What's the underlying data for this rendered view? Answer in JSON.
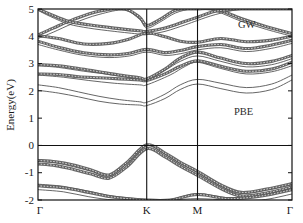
{
  "figure": {
    "title": "",
    "background_color": "#ffffff"
  },
  "axes": {
    "ylabel": "Energy(eV)",
    "xlabel": "",
    "y_ticks": [
      "5",
      "4",
      "3",
      "2",
      "1",
      "0",
      "-1",
      "-2"
    ],
    "x_ticks": [
      "Γ",
      "K",
      "M",
      "Γ"
    ]
  },
  "annotations": {
    "gw_label": "GW",
    "pbe_label": "PBE"
  },
  "chart_data": {
    "type": "line",
    "title": "",
    "xlabel": "",
    "ylabel": "Energy(eV)",
    "ylim": [
      -2,
      5
    ],
    "xlim": [
      0,
      1
    ],
    "grid": false,
    "legend_position": "in-plot-annotations",
    "x_tick_labels": [
      "Γ",
      "K",
      "M",
      "Γ"
    ],
    "x_tick_positions": [
      0.0,
      0.428,
      0.628,
      1.0
    ],
    "y_tick_values": [
      5,
      4,
      3,
      2,
      1,
      0,
      -1,
      -2
    ],
    "high_symmetry_lines": [
      0.428,
      0.628
    ],
    "zero_line": 0,
    "colors": {
      "gw_band": "#5a5a5a",
      "pbe_band": "#4a4a4a",
      "frame": "#111111"
    },
    "series": [
      {
        "name": "GW",
        "style": "thick-with-open-circle-markers",
        "description": "Quasiparticle GW band structure, drawn as thick dotted/circle-marker curves, blue-shifted relative to PBE",
        "bands": [
          {
            "label": "v1",
            "x": [
              0.0,
              0.07,
              0.14,
              0.21,
              0.28,
              0.35,
              0.428,
              0.5,
              0.56,
              0.628,
              0.72,
              0.8,
              0.9,
              1.0
            ],
            "y": [
              -0.55,
              -0.6,
              -0.72,
              -0.9,
              -1.08,
              -0.62,
              0.02,
              -0.28,
              -0.62,
              -0.95,
              -1.45,
              -1.72,
              -1.6,
              -1.4
            ]
          },
          {
            "label": "v2",
            "x": [
              0.0,
              0.07,
              0.14,
              0.21,
              0.28,
              0.35,
              0.428,
              0.5,
              0.56,
              0.628,
              0.72,
              0.8,
              0.9,
              1.0
            ],
            "y": [
              -0.68,
              -0.74,
              -0.88,
              -1.05,
              -1.2,
              -0.78,
              -0.12,
              -0.42,
              -0.76,
              -1.1,
              -1.58,
              -1.85,
              -1.74,
              -1.52
            ]
          },
          {
            "label": "v3",
            "x": [
              0.0,
              0.1,
              0.2,
              0.3,
              0.428,
              0.52,
              0.628,
              0.75,
              0.88,
              1.0
            ],
            "y": [
              -1.48,
              -1.55,
              -1.72,
              -1.9,
              -2.0,
              -2.0,
              -1.8,
              -1.95,
              -1.85,
              -1.62
            ]
          },
          {
            "label": "c1",
            "x": [
              0.0,
              0.08,
              0.16,
              0.24,
              0.32,
              0.4,
              0.428,
              0.5,
              0.56,
              0.628,
              0.72,
              0.82,
              0.92,
              1.0
            ],
            "y": [
              2.62,
              2.6,
              2.52,
              2.48,
              2.44,
              2.4,
              2.38,
              2.62,
              2.9,
              3.1,
              2.9,
              2.72,
              2.8,
              3.05
            ]
          },
          {
            "label": "c2",
            "x": [
              0.0,
              0.08,
              0.16,
              0.24,
              0.32,
              0.4,
              0.428,
              0.5,
              0.56,
              0.628,
              0.72,
              0.82,
              0.92,
              1.0
            ],
            "y": [
              2.96,
              2.92,
              2.82,
              2.7,
              2.58,
              2.48,
              2.44,
              2.8,
              3.2,
              3.42,
              3.2,
              3.0,
              3.08,
              3.3
            ]
          },
          {
            "label": "c3",
            "x": [
              0.0,
              0.08,
              0.18,
              0.28,
              0.36,
              0.428,
              0.5,
              0.56,
              0.628,
              0.72,
              0.82,
              0.92,
              1.0
            ],
            "y": [
              3.82,
              3.6,
              3.4,
              3.32,
              3.38,
              3.52,
              3.4,
              3.48,
              3.62,
              3.7,
              3.55,
              3.68,
              3.85
            ]
          },
          {
            "label": "c4",
            "x": [
              0.0,
              0.08,
              0.18,
              0.28,
              0.36,
              0.428,
              0.5,
              0.56,
              0.628,
              0.72,
              0.82,
              0.92,
              1.0
            ],
            "y": [
              4.02,
              3.92,
              3.72,
              3.74,
              3.9,
              4.12,
              3.98,
              3.82,
              3.78,
              3.92,
              3.8,
              3.86,
              4.0
            ]
          },
          {
            "label": "c5",
            "x": [
              0.0,
              0.06,
              0.14,
              0.24,
              0.34,
              0.4,
              0.428,
              0.48,
              0.54,
              0.6,
              0.628,
              0.7,
              0.8,
              0.9,
              1.0
            ],
            "y": [
              4.05,
              4.3,
              4.62,
              4.92,
              5.0,
              4.7,
              4.4,
              4.62,
              4.95,
              5.0,
              5.0,
              5.0,
              4.65,
              4.35,
              4.1
            ]
          },
          {
            "label": "c6",
            "x": [
              0.0,
              0.05,
              0.12,
              0.2,
              0.3,
              0.4,
              0.428,
              0.5,
              0.58,
              0.628,
              0.7,
              0.8,
              0.9,
              1.0
            ],
            "y": [
              5.0,
              4.8,
              4.55,
              4.42,
              4.3,
              4.2,
              4.18,
              4.3,
              4.55,
              4.7,
              4.92,
              5.0,
              5.0,
              5.0
            ]
          }
        ]
      },
      {
        "name": "PBE",
        "style": "thin-solid",
        "description": "DFT-PBE band structure, thin solid lines lying below the GW curves in the conduction region",
        "bands": [
          {
            "label": "v1",
            "x": [
              0.0,
              0.07,
              0.14,
              0.21,
              0.28,
              0.35,
              0.428,
              0.5,
              0.56,
              0.628,
              0.72,
              0.8,
              0.9,
              1.0
            ],
            "y": [
              -0.58,
              -0.64,
              -0.78,
              -0.95,
              -1.12,
              -0.66,
              0.0,
              -0.32,
              -0.66,
              -1.0,
              -1.5,
              -1.76,
              -1.64,
              -1.44
            ]
          },
          {
            "label": "v2",
            "x": [
              0.0,
              0.1,
              0.2,
              0.3,
              0.428,
              0.52,
              0.628,
              0.75,
              0.88,
              1.0
            ],
            "y": [
              -1.42,
              -1.5,
              -1.68,
              -1.86,
              -1.98,
              -1.98,
              -1.76,
              -1.92,
              -1.82,
              -1.58
            ]
          },
          {
            "label": "v3",
            "x": [
              0.0,
              0.1,
              0.2,
              0.3,
              0.428,
              0.52,
              0.628,
              0.75,
              0.88,
              1.0
            ],
            "y": [
              -1.62,
              -1.7,
              -1.88,
              -2.0,
              -2.0,
              -2.0,
              -1.95,
              -2.0,
              -2.0,
              -1.78
            ]
          },
          {
            "label": "c1",
            "x": [
              0.0,
              0.08,
              0.16,
              0.24,
              0.32,
              0.4,
              0.428,
              0.5,
              0.56,
              0.628,
              0.72,
              0.82,
              0.92,
              1.0
            ],
            "y": [
              2.02,
              1.92,
              1.78,
              1.62,
              1.52,
              1.48,
              1.46,
              1.72,
              2.05,
              2.25,
              2.08,
              1.92,
              2.05,
              2.4
            ]
          },
          {
            "label": "c2",
            "x": [
              0.0,
              0.08,
              0.16,
              0.24,
              0.32,
              0.4,
              0.428,
              0.5,
              0.56,
              0.628,
              0.72,
              0.82,
              0.92,
              1.0
            ],
            "y": [
              2.22,
              2.12,
              1.96,
              1.8,
              1.68,
              1.6,
              1.58,
              1.88,
              2.22,
              2.42,
              2.28,
              2.12,
              2.25,
              2.58
            ]
          },
          {
            "label": "c3",
            "x": [
              0.0,
              0.1,
              0.2,
              0.3,
              0.4,
              0.428,
              0.52,
              0.58,
              0.628,
              0.72,
              0.82,
              0.92,
              1.0
            ],
            "y": [
              2.58,
              2.5,
              2.38,
              2.28,
              2.22,
              2.22,
              2.58,
              2.9,
              3.05,
              2.82,
              2.62,
              2.7,
              2.92
            ]
          },
          {
            "label": "c4",
            "x": [
              0.0,
              0.08,
              0.18,
              0.28,
              0.36,
              0.428,
              0.5,
              0.56,
              0.628,
              0.72,
              0.82,
              0.92,
              1.0
            ],
            "y": [
              2.92,
              2.86,
              2.72,
              2.6,
              2.48,
              2.4,
              2.75,
              3.08,
              3.28,
              3.08,
              2.88,
              2.96,
              3.18
            ]
          },
          {
            "label": "c5",
            "x": [
              0.0,
              0.08,
              0.18,
              0.28,
              0.36,
              0.428,
              0.5,
              0.56,
              0.628,
              0.72,
              0.82,
              0.92,
              1.0
            ],
            "y": [
              3.7,
              3.5,
              3.3,
              3.22,
              3.28,
              3.42,
              3.3,
              3.36,
              3.5,
              3.58,
              3.44,
              3.56,
              3.74
            ]
          },
          {
            "label": "c6",
            "x": [
              0.0,
              0.06,
              0.14,
              0.24,
              0.34,
              0.4,
              0.428,
              0.48,
              0.54,
              0.6,
              0.628,
              0.7,
              0.8,
              0.9,
              1.0
            ],
            "y": [
              3.92,
              4.15,
              4.48,
              4.8,
              4.96,
              4.62,
              4.3,
              4.52,
              4.85,
              5.0,
              5.0,
              4.92,
              4.55,
              4.25,
              4.0
            ]
          },
          {
            "label": "c7",
            "x": [
              0.0,
              0.05,
              0.12,
              0.2,
              0.3,
              0.4,
              0.428,
              0.5,
              0.58,
              0.628,
              0.7,
              0.8,
              0.9,
              1.0
            ],
            "y": [
              4.95,
              4.72,
              4.45,
              4.3,
              4.18,
              4.08,
              4.06,
              4.18,
              4.42,
              4.58,
              4.8,
              5.0,
              5.0,
              5.0
            ]
          }
        ]
      }
    ]
  }
}
